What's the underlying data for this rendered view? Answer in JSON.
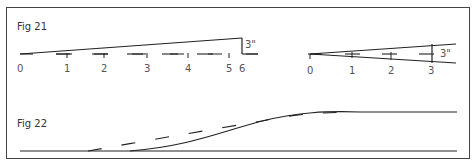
{
  "figures": [
    {
      "label": "Fig 21",
      "left_diagram": {
        "ticks": [
          "0",
          "1",
          "2",
          "3",
          "4",
          "5",
          "6"
        ],
        "dimension": "3\""
      },
      "right_diagram": {
        "ticks": [
          "0",
          "1",
          "2",
          "3"
        ],
        "dimension": "3\""
      }
    },
    {
      "label": "Fig 22"
    }
  ],
  "colors": {
    "line": "#222222",
    "border": "#444444",
    "text": "#333333"
  }
}
